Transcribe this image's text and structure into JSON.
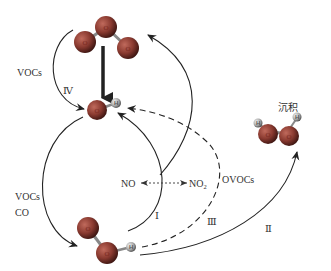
{
  "diagram": {
    "type": "reaction-cycle",
    "species": {
      "o3": {
        "atom_labels": [
          "O",
          "O",
          "O"
        ]
      },
      "oh": {
        "atom_labels": [
          "O",
          "H"
        ]
      },
      "ho2": {
        "atom_labels": [
          "O",
          "O",
          "H"
        ]
      },
      "h2o2": {
        "atom_labels": [
          "H",
          "O",
          "O",
          "H"
        ],
        "caption": "沉积"
      }
    },
    "labels": {
      "vocs_top": "VOCs",
      "path_iv": "Ⅳ",
      "vocs_bottom": "VOCs",
      "co": "CO",
      "no": "NO",
      "no2_main": "NO",
      "no2_sub": "2",
      "path_i": "Ⅰ",
      "ovocs": "OVOCs",
      "path_iii": "Ⅲ",
      "path_ii": "Ⅱ"
    },
    "colors": {
      "oxygen": "#8a3a30",
      "hydrogen": "#b0b0b0",
      "line": "#222222"
    },
    "edges": [
      {
        "from": "O3",
        "to": "OH",
        "style": "thick-solid"
      },
      {
        "from": "O3",
        "to": "OH",
        "via": "VOCs",
        "label": "Ⅳ",
        "style": "solid"
      },
      {
        "from": "OH",
        "to": "HO2",
        "via": "VOCs, CO",
        "style": "solid"
      },
      {
        "from": "HO2",
        "to": "OH",
        "via": "NO→NO2",
        "label": "Ⅰ",
        "style": "solid"
      },
      {
        "from": "HO2",
        "to": "O3",
        "style": "solid"
      },
      {
        "from": "HO2",
        "to": "OH",
        "via": "OVOCs",
        "label": "Ⅲ",
        "style": "dashed"
      },
      {
        "from": "HO2",
        "to": "H2O2 (沉积)",
        "label": "Ⅱ",
        "style": "solid"
      },
      {
        "from": "NO",
        "to": "NO2",
        "style": "dotted-bidirectional"
      }
    ]
  }
}
